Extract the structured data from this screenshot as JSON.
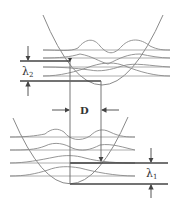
{
  "labels": {
    "lambda2": "λ",
    "lambda2_sub": "2",
    "lambda1": "λ",
    "lambda1_sub": "1",
    "displacement": "D"
  },
  "colors": {
    "line": "#8a8a8a",
    "thick": "#444444",
    "text": "#333333"
  }
}
